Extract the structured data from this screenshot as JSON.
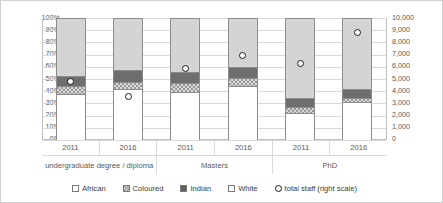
{
  "chart_data": {
    "type": "bar",
    "title": "",
    "subtitle": "",
    "xlabel": "",
    "ylabel": "",
    "stacked": true,
    "stack_order_bottom_to_top": [
      "White",
      "Coloured",
      "Indian",
      "African"
    ],
    "grid": true,
    "legend_position": "bottom",
    "categories": [
      "2011",
      "2016",
      "2011",
      "2016",
      "2011",
      "2016"
    ],
    "group_labels": [
      "undergraduate degree / diploma",
      "Masters",
      "PhD"
    ],
    "left_axis": {
      "label": "",
      "ylim": [
        0,
        100
      ],
      "tick_step": 10,
      "tick_labels": [
        "0%",
        "10%",
        "20%",
        "30%",
        "40%",
        "50%",
        "60%",
        "70%",
        "80%",
        "90%",
        "100%"
      ],
      "tick_values": [
        0,
        10,
        20,
        30,
        40,
        50,
        60,
        70,
        80,
        90,
        100
      ]
    },
    "right_axis": {
      "label": "total staff (right scale)",
      "ylim": [
        0,
        10000
      ],
      "tick_step": 1000,
      "tick_labels": [
        "0",
        "1,000",
        "2,000",
        "3,000",
        "4,000",
        "5,000",
        "6,000",
        "7,000",
        "8,000",
        "9,000",
        "10,000"
      ],
      "tick_values": [
        0,
        1000,
        2000,
        3000,
        4000,
        5000,
        6000,
        7000,
        8000,
        9000,
        10000
      ]
    },
    "series": [
      {
        "name": "White",
        "values": [
          38,
          42,
          40,
          45,
          22,
          31
        ]
      },
      {
        "name": "Coloured",
        "values": [
          7,
          6,
          7,
          6,
          5,
          4
        ]
      },
      {
        "name": "Indian",
        "values": [
          8,
          10,
          9,
          9,
          8,
          7
        ]
      },
      {
        "name": "African",
        "values": [
          47,
          42,
          44,
          40,
          65,
          58
        ]
      }
    ],
    "marker_series": {
      "name": "total staff (right scale)",
      "axis": "right",
      "values": [
        4800,
        3600,
        5900,
        6900,
        6300,
        8800
      ]
    },
    "bars": [
      {
        "group": "undergraduate degree / diploma",
        "year": "2011",
        "white": 38,
        "coloured": 7,
        "indian": 8,
        "african": 47,
        "total_staff": 4800
      },
      {
        "group": "undergraduate degree / diploma",
        "year": "2016",
        "white": 42,
        "coloured": 6,
        "indian": 10,
        "african": 42,
        "total_staff": 3600
      },
      {
        "group": "Masters",
        "year": "2011",
        "white": 40,
        "coloured": 7,
        "indian": 9,
        "african": 44,
        "total_staff": 5900
      },
      {
        "group": "Masters",
        "year": "2016",
        "white": 45,
        "coloured": 6,
        "indian": 9,
        "african": 40,
        "total_staff": 6900
      },
      {
        "group": "PhD",
        "year": "2011",
        "white": 22,
        "coloured": 5,
        "indian": 8,
        "african": 65,
        "total_staff": 6300
      },
      {
        "group": "PhD",
        "year": "2016",
        "white": 31,
        "coloured": 4,
        "indian": 7,
        "african": 58,
        "total_staff": 8800
      }
    ]
  },
  "legend": {
    "items": [
      {
        "label": "African",
        "icon": "square-outline-icon"
      },
      {
        "label": "Coloured",
        "icon": "square-hatched-icon"
      },
      {
        "label": "Indian",
        "icon": "square-filled-icon"
      },
      {
        "label": "White",
        "icon": "square-outline-icon"
      },
      {
        "label": "total staff (right scale)",
        "icon": "circle-marker-icon"
      }
    ]
  },
  "colors": {
    "african": "#d4d4d4",
    "coloured": "#9a9a9a",
    "indian": "#6e6e6e",
    "white": "#ffffff",
    "marker_outline": "#1a1a1a",
    "gridline": "#d9d9d9",
    "axis": "#bfbfbf",
    "text": "#3a3a3a"
  }
}
